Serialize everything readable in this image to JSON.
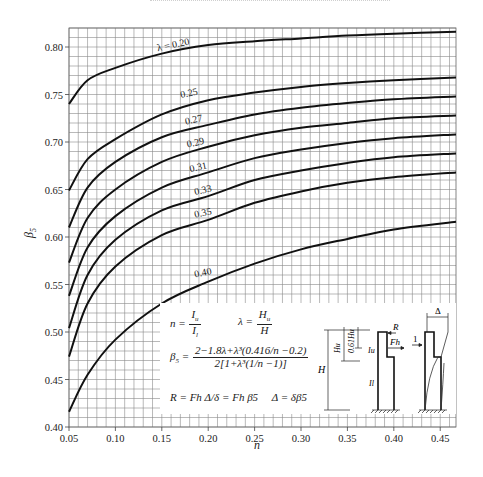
{
  "chart_data": {
    "type": "line",
    "title": "",
    "xlabel": "n",
    "ylabel": "β5",
    "xlim": [
      0.05,
      0.467
    ],
    "ylim": [
      0.4,
      0.82
    ],
    "grid": true,
    "grid_minor_step_x": 0.01,
    "grid_minor_step_y": 0.01,
    "x_ticks": [
      0.05,
      0.1,
      0.15,
      0.2,
      0.25,
      0.3,
      0.35,
      0.4,
      0.45
    ],
    "x_tick_labels": [
      "0.05",
      "0.10",
      "0.15",
      "0.20",
      "0.25",
      "0.30",
      "0.35",
      "0.40",
      "0.45"
    ],
    "y_ticks": [
      0.4,
      0.45,
      0.5,
      0.55,
      0.6,
      0.65,
      0.7,
      0.75,
      0.8
    ],
    "y_tick_labels": [
      "0.40",
      "0.45",
      "0.50",
      "0.55",
      "0.60",
      "0.65",
      "0.70",
      "0.75",
      "0.80"
    ],
    "x": [
      0.05,
      0.07,
      0.1,
      0.15,
      0.2,
      0.25,
      0.3,
      0.35,
      0.4,
      0.467
    ],
    "series": [
      {
        "name": "λ=0.20",
        "label": "λ = 0.20",
        "label_at": [
          0.163,
          0.796
        ],
        "values": [
          0.74,
          0.765,
          0.778,
          0.793,
          0.802,
          0.806,
          0.809,
          0.812,
          0.814,
          0.816
        ]
      },
      {
        "name": "λ=0.25",
        "label": "0.25",
        "label_at": [
          0.18,
          0.745
        ],
        "values": [
          0.649,
          0.682,
          0.703,
          0.729,
          0.744,
          0.752,
          0.758,
          0.762,
          0.765,
          0.768
        ]
      },
      {
        "name": "λ=0.27",
        "label": "0.27",
        "label_at": [
          0.185,
          0.717
        ],
        "values": [
          0.61,
          0.652,
          0.679,
          0.705,
          0.718,
          0.729,
          0.736,
          0.741,
          0.745,
          0.748
        ]
      },
      {
        "name": "λ=0.29",
        "label": "0.29",
        "label_at": [
          0.187,
          0.693
        ],
        "values": [
          0.573,
          0.62,
          0.65,
          0.679,
          0.695,
          0.707,
          0.715,
          0.72,
          0.725,
          0.728
        ]
      },
      {
        "name": "λ=0.31",
        "label": "0.31",
        "label_at": [
          0.19,
          0.667
        ],
        "values": [
          0.538,
          0.589,
          0.622,
          0.652,
          0.668,
          0.683,
          0.692,
          0.699,
          0.704,
          0.708
        ]
      },
      {
        "name": "λ=0.33",
        "label": "0.33",
        "label_at": [
          0.195,
          0.643
        ],
        "values": [
          0.504,
          0.56,
          0.597,
          0.628,
          0.643,
          0.66,
          0.67,
          0.678,
          0.684,
          0.688
        ]
      },
      {
        "name": "λ=0.35",
        "label": "0.35",
        "label_at": [
          0.195,
          0.619
        ],
        "values": [
          0.474,
          0.53,
          0.569,
          0.602,
          0.618,
          0.636,
          0.648,
          0.657,
          0.663,
          0.668
        ]
      },
      {
        "name": "λ=0.40",
        "label": "0.40",
        "label_at": [
          0.195,
          0.556
        ],
        "values": [
          0.416,
          0.455,
          0.492,
          0.53,
          0.553,
          0.572,
          0.587,
          0.598,
          0.608,
          0.616
        ]
      }
    ],
    "legend_position": "inset-bottom-right",
    "annotations": {
      "definitions": {
        "n_lhs": "n =",
        "n_num": "I",
        "n_num_sub": "u",
        "n_den": "I",
        "n_den_sub": "l",
        "lambda_lhs": "λ =",
        "lambda_num": "H",
        "lambda_num_sub": "u",
        "lambda_den": "H"
      },
      "beta_formula": {
        "lhs": "β",
        "lhs_sub": "5",
        "eq": "=",
        "numerator": "2−1.8λ+λ³(0.416/n −0.2)",
        "denominator": "2[1+λ³(1/n −1)]"
      },
      "r_formula": "R = Fh Δ/δ = Fh β5",
      "delta_formula": "Δ = δβ5",
      "diagram_labels": {
        "H": "H",
        "Hu": "Hu",
        "d061Hu": "0.61Hu",
        "Iu": "Iu",
        "Il": "Il",
        "R": "R",
        "Fh": "Fh",
        "one": "1",
        "Delta": "Δ"
      }
    }
  }
}
